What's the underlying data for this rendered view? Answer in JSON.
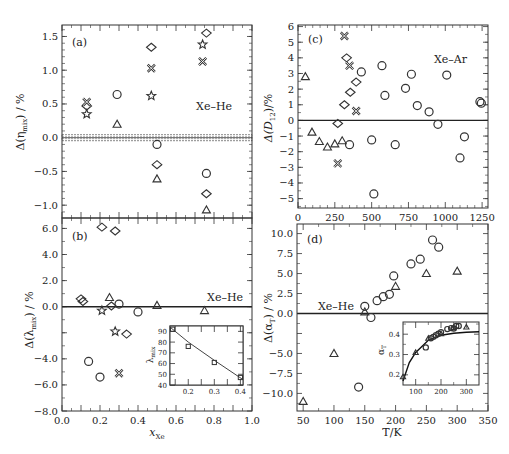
{
  "chart_data": [
    {
      "panel": "(a)",
      "type": "scatter",
      "annotation": "Xe–He",
      "xlabel": "",
      "ylabel": "Δ(ηmix) / %",
      "xlim": [
        0.0,
        1.0
      ],
      "ylim": [
        -1.19,
        1.67
      ],
      "yticks": [
        "1.5",
        "1.0",
        "0.5",
        "0.0",
        "-0.5",
        "-1.0"
      ],
      "zero_band": true,
      "series": [
        {
          "marker": "circle",
          "points": [
            [
              0.29,
              0.64
            ],
            [
              0.5,
              -0.1
            ],
            [
              0.76,
              -0.53
            ]
          ]
        },
        {
          "marker": "triangle",
          "points": [
            [
              0.29,
              0.2
            ],
            [
              0.5,
              -0.61
            ],
            [
              0.76,
              -1.07
            ]
          ]
        },
        {
          "marker": "diamond",
          "points": [
            [
              0.13,
              0.47
            ],
            [
              0.47,
              1.34
            ],
            [
              0.76,
              1.55
            ],
            [
              0.5,
              -0.4
            ],
            [
              0.76,
              -0.83
            ]
          ]
        },
        {
          "marker": "cross",
          "points": [
            [
              0.13,
              0.53
            ],
            [
              0.47,
              1.03
            ],
            [
              0.74,
              1.13
            ]
          ]
        },
        {
          "marker": "star",
          "points": [
            [
              0.13,
              0.35
            ],
            [
              0.47,
              0.62
            ],
            [
              0.74,
              1.38
            ]
          ]
        }
      ]
    },
    {
      "panel": "(b)",
      "type": "scatter",
      "annotation": "Xe–He",
      "xlabel": "xXe",
      "ylabel": "Δ(λmix) / %",
      "xlim": [
        0.0,
        1.0
      ],
      "ylim": [
        -8.0,
        6.8
      ],
      "xticks": [
        "0.0",
        "0.2",
        "0.4",
        "0.6",
        "0.8",
        "1.0"
      ],
      "yticks": [
        "6.0",
        "4.0",
        "2.0",
        "0.0",
        "-4.0",
        "-6.0",
        "-8.0"
      ],
      "series": [
        {
          "marker": "circle",
          "points": [
            [
              0.14,
              -4.2
            ],
            [
              0.2,
              -5.4
            ],
            [
              0.3,
              0.2
            ],
            [
              0.4,
              -0.4
            ]
          ]
        },
        {
          "marker": "triangle",
          "points": [
            [
              0.25,
              0.7
            ],
            [
              0.5,
              0.1
            ],
            [
              0.75,
              -0.3
            ]
          ]
        },
        {
          "marker": "diamond",
          "points": [
            [
              0.21,
              6.1
            ],
            [
              0.28,
              5.8
            ],
            [
              0.1,
              0.6
            ],
            [
              0.11,
              0.4
            ],
            [
              0.26,
              0.05
            ],
            [
              0.34,
              -2.1
            ]
          ]
        },
        {
          "marker": "cross",
          "points": [
            [
              0.3,
              -5.1
            ]
          ]
        },
        {
          "marker": "star",
          "points": [
            [
              0.21,
              -0.3
            ],
            [
              0.28,
              -1.9
            ]
          ]
        }
      ],
      "inset": {
        "type": "line+scatter",
        "ylabel": "λmix",
        "xticks": [
          "0.2",
          "0.3",
          "0.4"
        ],
        "yticks": [
          "40",
          "50",
          "60",
          "70",
          "80",
          "90"
        ],
        "xlim": [
          0.13,
          0.41
        ],
        "ylim": [
          40,
          95
        ],
        "points": [
          [
            0.14,
            92
          ],
          [
            0.2,
            76
          ],
          [
            0.3,
            61
          ],
          [
            0.4,
            47
          ]
        ],
        "curve": [
          [
            0.13,
            94
          ],
          [
            0.2,
            80
          ],
          [
            0.3,
            63
          ],
          [
            0.41,
            45
          ]
        ]
      }
    },
    {
      "panel": "(c)",
      "type": "scatter",
      "annotation": "Xe–Ar",
      "xlabel": "",
      "ylabel": "Δ(D12)/%",
      "xlim": [
        0,
        1290
      ],
      "ylim": [
        -5.7,
        6
      ],
      "xticks": [
        "0",
        "250",
        "500",
        "750",
        "1000",
        "1250"
      ],
      "yticks": [
        "6",
        "5",
        "4",
        "3",
        "2",
        "1",
        "0",
        "-1",
        "-2",
        "-3",
        "-4",
        "-5"
      ],
      "series": [
        {
          "marker": "circle",
          "points": [
            [
              350,
              -1.55
            ],
            [
              430,
              3.1
            ],
            [
              500,
              -1.25
            ],
            [
              515,
              -4.7
            ],
            [
              570,
              3.5
            ],
            [
              590,
              1.6
            ],
            [
              660,
              -1.55
            ],
            [
              730,
              2.05
            ],
            [
              770,
              2.95
            ],
            [
              810,
              0.95
            ],
            [
              890,
              0.55
            ],
            [
              950,
              -0.25
            ],
            [
              1010,
              2.9
            ],
            [
              1100,
              -2.4
            ],
            [
              1130,
              -1.05
            ],
            [
              1235,
              1.2
            ],
            [
              1245,
              1.1
            ]
          ]
        },
        {
          "marker": "triangle",
          "points": [
            [
              50,
              2.8
            ],
            [
              95,
              -0.75
            ],
            [
              145,
              -1.35
            ],
            [
              200,
              -1.7
            ],
            [
              250,
              -1.5
            ],
            [
              300,
              -1.3
            ]
          ]
        },
        {
          "marker": "diamond",
          "points": [
            [
              270,
              -0.2
            ],
            [
              315,
              1.0
            ],
            [
              355,
              1.8
            ],
            [
              395,
              2.45
            ],
            [
              330,
              4.0
            ]
          ]
        },
        {
          "marker": "cross",
          "points": [
            [
              315,
              5.4
            ],
            [
              350,
              3.5
            ],
            [
              395,
              0.6
            ],
            [
              270,
              -2.75
            ]
          ]
        }
      ]
    },
    {
      "panel": "(d)",
      "type": "scatter",
      "annotation": "Xe–He",
      "xlabel": "T/K",
      "ylabel": "Δ(αT) / %",
      "xlim": [
        40,
        350
      ],
      "ylim": [
        -12,
        11.2
      ],
      "xticks": [
        "50",
        "100",
        "150",
        "200",
        "250",
        "300",
        "350"
      ],
      "yticks": [
        "10.0",
        "7.5",
        "5.0",
        "2.5",
        "0.0",
        "-5.0",
        "-7.5",
        "-10.0"
      ],
      "series": [
        {
          "marker": "circle",
          "points": [
            [
              140,
              -9.2
            ],
            [
              150,
              0.9
            ],
            [
              160,
              -0.5
            ],
            [
              170,
              1.6
            ],
            [
              180,
              2.1
            ],
            [
              190,
              2.4
            ],
            [
              197,
              4.7
            ],
            [
              225,
              6.2
            ],
            [
              240,
              6.8
            ],
            [
              260,
              9.2
            ],
            [
              270,
              8.3
            ]
          ]
        },
        {
          "marker": "triangle",
          "points": [
            [
              50,
              -11
            ],
            [
              100,
              -5
            ],
            [
              150,
              0.2
            ],
            [
              200,
              3.4
            ],
            [
              250,
              5.0
            ],
            [
              300,
              5.3
            ]
          ]
        }
      ],
      "inset": {
        "type": "line+scatter",
        "ylabel": "αT",
        "xticks": [
          "100",
          "200",
          "300"
        ],
        "yticks": [
          "0.2",
          "0.3",
          "0.4"
        ],
        "xlim": [
          50,
          350
        ],
        "ylim": [
          0.15,
          0.46
        ],
        "circles": [
          [
            140,
            0.335
          ],
          [
            160,
            0.38
          ],
          [
            170,
            0.387
          ],
          [
            180,
            0.395
          ],
          [
            190,
            0.402
          ],
          [
            200,
            0.41
          ],
          [
            225,
            0.425
          ],
          [
            240,
            0.43
          ],
          [
            250,
            0.428
          ],
          [
            260,
            0.44
          ],
          [
            270,
            0.44
          ]
        ],
        "triangles": [
          [
            50,
            0.19
          ],
          [
            100,
            0.31
          ],
          [
            150,
            0.38
          ],
          [
            200,
            0.402
          ],
          [
            250,
            0.432
          ],
          [
            300,
            0.435
          ]
        ],
        "curve": [
          [
            50,
            0.17
          ],
          [
            75,
            0.26
          ],
          [
            100,
            0.31
          ],
          [
            150,
            0.37
          ],
          [
            200,
            0.395
          ],
          [
            250,
            0.405
          ],
          [
            300,
            0.41
          ],
          [
            350,
            0.412
          ]
        ]
      }
    }
  ],
  "labels": {
    "panel_a": "(a)",
    "panel_b": "(b)",
    "panel_c": "(c)",
    "panel_d": "(d)",
    "xe_he": "Xe–He",
    "xe_ar": "Xe–Ar",
    "xlabel_b_main": "x",
    "xlabel_b_sub": "Xe",
    "xlabel_d": "T/K",
    "ylabel_a": "Δ(η",
    "ylabel_a_sub": "mix",
    "ylabel_a_end": ") / %",
    "ylabel_b": "Δ(λ",
    "ylabel_b_sub": "mix",
    "ylabel_b_end": ") / %",
    "ylabel_c": "Δ(D",
    "ylabel_c_sub": "12",
    "ylabel_c_end": ")/%",
    "ylabel_d": "Δ(α",
    "ylabel_d_sub": "T",
    "ylabel_d_end": ") / %",
    "inset_b_ylabel": "λ",
    "inset_b_ylabel_sub": "mix",
    "inset_d_ylabel": "α",
    "inset_d_ylabel_sub": "T"
  }
}
